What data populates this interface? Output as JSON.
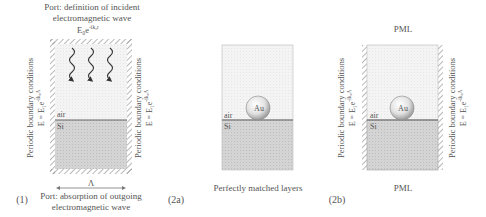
{
  "panel1": {
    "label": "(1)",
    "top_port_line1": "Port: definition of incident",
    "top_port_line2": "electromagnetic wave",
    "incident_field": "E₀e",
    "incident_field_exp": "-ik₀r",
    "left_bc": "Periodic boundary conditions",
    "left_bc_eq": "E = E₁e",
    "left_bc_exp": "-ik₀Λ",
    "right_bc": "Periodic boundary conditions",
    "right_bc_eq": "E = E₁e",
    "right_bc_exp": "-ik₀Λ",
    "layer_air": "air",
    "layer_si": "Si",
    "period_symbol": "Λ",
    "bottom_port_line1": "Port: absorption of outgoing",
    "bottom_port_line2": "electromagnetic wave"
  },
  "panel2a": {
    "label": "(2a)",
    "particle": "Au",
    "layer_air": "air",
    "layer_si": "Si",
    "bottom_caption": "Perfectly matched layers"
  },
  "panel2b": {
    "label": "(2b)",
    "top_caption": "PML",
    "bottom_caption": "PML",
    "particle": "Au",
    "layer_air": "air",
    "layer_si": "Si",
    "left_bc": "Periodic boundary conditions",
    "left_bc_eq": "E = E₁e",
    "left_bc_exp": "-ik₀Λ",
    "right_bc": "Periodic boundary conditions",
    "right_bc_eq": "E = E₁e",
    "right_bc_exp": "-ik₀Λ"
  },
  "colors": {
    "air_fill": "#f3f3f3",
    "si_fill": "#d6d6d6",
    "outline": "#9a9a9a",
    "interface": "#666666",
    "hatch": "#888888",
    "text": "#555555"
  }
}
